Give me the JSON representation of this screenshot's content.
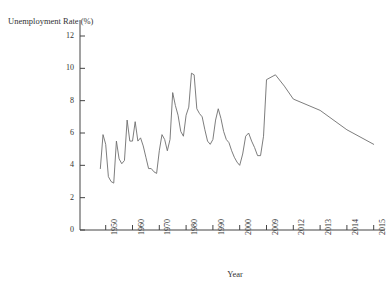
{
  "chart_data": {
    "type": "line",
    "title": "",
    "xlabel": "Year",
    "ylabel": "Unemployment Rate (%)",
    "ylim": [
      0,
      12
    ],
    "ytick_labels": [
      "0",
      "2",
      "4",
      "6",
      "8",
      "10",
      "12"
    ],
    "ytick_values": [
      0,
      2,
      4,
      6,
      8,
      10,
      12
    ],
    "xtick_labels": [
      "1950",
      "1960",
      "1970",
      "1980",
      "1990",
      "2000",
      "2009",
      "2012",
      "2013",
      "2014",
      "2015"
    ],
    "xtick_values": [
      1950,
      1960,
      1970,
      1980,
      1990,
      2000,
      2009,
      2012,
      2013,
      2014,
      2015
    ],
    "grid": false,
    "legend": "none",
    "line_color": "#6e6e6e",
    "axis_color": "#444444",
    "note": "x-axis uses irregular (non-linear) spacing: decades to 2000, then annual 2009-2015",
    "x": [
      1948,
      1949,
      1950,
      1951,
      1952,
      1953,
      1954,
      1955,
      1956,
      1957,
      1958,
      1959,
      1960,
      1961,
      1962,
      1963,
      1964,
      1965,
      1966,
      1967,
      1968,
      1969,
      1970,
      1971,
      1972,
      1973,
      1974,
      1975,
      1976,
      1977,
      1978,
      1979,
      1980,
      1981,
      1982,
      1983,
      1984,
      1985,
      1986,
      1987,
      1988,
      1989,
      1990,
      1991,
      1992,
      1993,
      1994,
      1995,
      1996,
      1997,
      1998,
      1999,
      2000,
      2001,
      2002,
      2003,
      2004,
      2005,
      2006,
      2007,
      2008,
      2009,
      2010,
      2011,
      2012,
      2013,
      2014,
      2015
    ],
    "values": [
      3.8,
      5.9,
      5.3,
      3.3,
      3.0,
      2.9,
      5.5,
      4.4,
      4.1,
      4.3,
      6.8,
      5.5,
      5.5,
      6.7,
      5.5,
      5.7,
      5.2,
      4.5,
      3.8,
      3.8,
      3.6,
      3.5,
      4.9,
      5.9,
      5.6,
      4.9,
      5.6,
      8.5,
      7.7,
      7.1,
      6.1,
      5.8,
      7.1,
      7.6,
      9.7,
      9.6,
      7.5,
      7.2,
      7.0,
      6.2,
      5.5,
      5.3,
      5.6,
      6.8,
      7.5,
      6.9,
      6.1,
      5.6,
      5.4,
      4.9,
      4.5,
      4.2,
      4.0,
      4.7,
      5.8,
      6.0,
      5.5,
      5.1,
      4.6,
      4.6,
      5.8,
      9.3,
      9.6,
      8.9,
      8.1,
      7.4,
      6.2,
      5.3
    ]
  }
}
